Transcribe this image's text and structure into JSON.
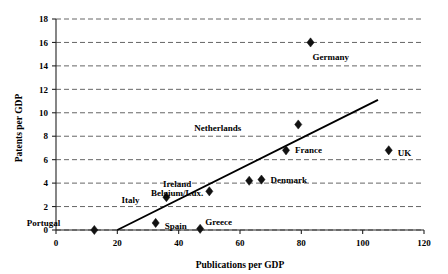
{
  "chart_data": {
    "type": "scatter",
    "title": "",
    "xlabel": "Publications per GDP",
    "ylabel": "Patents per GDP",
    "xlim": [
      0,
      120
    ],
    "ylim": [
      0,
      18
    ],
    "xticks": [
      0,
      20,
      40,
      60,
      80,
      100,
      120
    ],
    "yticks": [
      0,
      2,
      4,
      6,
      8,
      10,
      12,
      14,
      16,
      18
    ],
    "grid": "horizontal-dashed",
    "legend": "none",
    "marker": "diamond",
    "marker_color": "#111111",
    "points": [
      {
        "label": "Portugal",
        "x": 12.5,
        "y": 0.0,
        "label_dx": -34,
        "label_dy": -7
      },
      {
        "label": "Spain",
        "x": 32.5,
        "y": 0.6,
        "label_dx": 9,
        "label_dy": 3
      },
      {
        "label": "Italy",
        "x": 36.0,
        "y": 2.8,
        "label_dx": -27,
        "label_dy": 3
      },
      {
        "label": "Greece",
        "x": 47.0,
        "y": 0.1,
        "label_dx": 5,
        "label_dy": -7
      },
      {
        "label": "Ireland",
        "x": 50.0,
        "y": 3.3,
        "label_dx": -18,
        "label_dy": -8
      },
      {
        "label": "Belgium/Lux.",
        "x": 63.0,
        "y": 4.2,
        "label_dx": -46,
        "label_dy": 12
      },
      {
        "label": "Denmark",
        "x": 67.0,
        "y": 4.3,
        "label_dx": 9,
        "label_dy": 0
      },
      {
        "label": "France",
        "x": 75.0,
        "y": 6.8,
        "label_dx": 9,
        "label_dy": 0
      },
      {
        "label": "Netherlands",
        "x": 79.0,
        "y": 9.0,
        "label_dx": -57,
        "label_dy": 3
      },
      {
        "label": "Germany",
        "x": 83.0,
        "y": 16.0,
        "label_dx": 2,
        "label_dy": 14
      },
      {
        "label": "UK",
        "x": 108.5,
        "y": 6.8,
        "label_dx": 9,
        "label_dy": 3
      }
    ],
    "trend_line": {
      "x_start": 20.0,
      "y_start": 0.0,
      "x_end": 105.0,
      "y_end": 11.1
    }
  }
}
